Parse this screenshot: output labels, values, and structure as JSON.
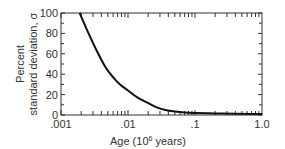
{
  "chart_data": {
    "type": "line",
    "title": "",
    "xlabel": "Age (10⁶ years)",
    "xlabel_parts": {
      "prefix": "Age (10",
      "sup": "6",
      "suffix": " years)"
    },
    "ylabel_line1": "Percent",
    "ylabel_line2": "standard deviation, σ",
    "xscale": "log",
    "xlim": [
      0.001,
      1.0
    ],
    "ylim": [
      0,
      100
    ],
    "x_tick_labels": [
      ".001",
      ".01",
      ".1",
      "1.0"
    ],
    "x_tick_values": [
      0.001,
      0.01,
      0.1,
      1.0
    ],
    "y_tick_labels": [
      "0",
      "20",
      "40",
      "60",
      "80",
      "100"
    ],
    "y_tick_values": [
      0,
      20,
      40,
      60,
      80,
      100
    ],
    "grid": false,
    "legend": null,
    "series": [
      {
        "name": "Percent standard deviation vs age",
        "x": [
          0.0019,
          0.0025,
          0.0033,
          0.0047,
          0.0062,
          0.0076,
          0.01,
          0.014,
          0.021,
          0.028,
          0.036,
          0.05,
          0.07,
          0.1,
          0.2,
          0.4,
          0.7,
          1.0
        ],
        "y": [
          100,
          82,
          65,
          46,
          36,
          30,
          24,
          17,
          11,
          7,
          5,
          3.5,
          2.5,
          2,
          1.5,
          1.2,
          1.0,
          1.0
        ],
        "color": "#111111"
      }
    ]
  }
}
